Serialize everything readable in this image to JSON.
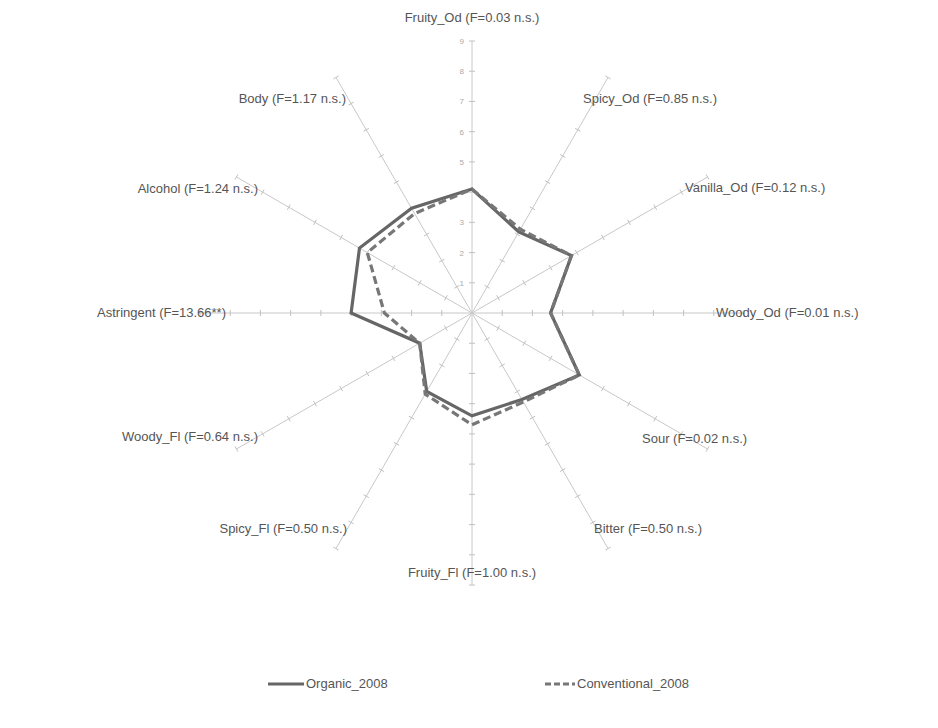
{
  "chart_data": {
    "type": "radar",
    "title": "",
    "axes": [
      {
        "name": "Fruity_Od",
        "label": "Fruity_Od (F=0.03 n.s.)"
      },
      {
        "name": "Spicy_Od",
        "label": "Spicy_Od (F=0.85 n.s.)"
      },
      {
        "name": "Vanilla_Od",
        "label": "Vanilla_Od (F=0.12 n.s.)"
      },
      {
        "name": "Woody_Od",
        "label": "Woody_Od (F=0.01 n.s.)"
      },
      {
        "name": "Sour",
        "label": "Sour (F=0.02 n.s.)"
      },
      {
        "name": "Bitter",
        "label": "Bitter (F=0.50 n.s.)"
      },
      {
        "name": "Fruity_Fl",
        "label": "Fruity_Fl (F=1.00 n.s.)"
      },
      {
        "name": "Spicy_Fl",
        "label": "Spicy_Fl (F=0.50 n.s.)"
      },
      {
        "name": "Woody_Fl",
        "label": "Woody_Fl (F=0.64 n.s.)"
      },
      {
        "name": "Astringent",
        "label": "Astringent (F=13.66**)"
      },
      {
        "name": "Alcohol",
        "label": "Alcohol (F=1.24 n.s.)"
      },
      {
        "name": "Body",
        "label": "Body (F=1.17 n.s.)"
      }
    ],
    "categories": [
      "Fruity_Od",
      "Spicy_Od",
      "Vanilla_Od",
      "Woody_Od",
      "Sour",
      "Bitter",
      "Fruity_Fl",
      "Spicy_Fl",
      "Woody_Fl",
      "Astringent",
      "Alcohol",
      "Body"
    ],
    "series": [
      {
        "name": "Organic_2008",
        "style": "solid",
        "color": "#666666",
        "values": [
          4.1,
          3.1,
          3.8,
          2.6,
          4.1,
          3.3,
          3.4,
          3.0,
          2.0,
          4.0,
          4.3,
          4.0
        ]
      },
      {
        "name": "Conventional_2008",
        "style": "dashed",
        "color": "#777777",
        "values": [
          4.1,
          3.2,
          3.8,
          2.6,
          4.1,
          3.4,
          3.7,
          3.1,
          2.0,
          2.9,
          4.0,
          3.8
        ]
      }
    ],
    "radial_ticks": [
      1,
      2,
      3,
      4,
      5,
      6,
      7,
      8,
      9
    ],
    "rlim": [
      0,
      9
    ],
    "grid": true,
    "legend_position": "bottom"
  },
  "legend": {
    "items": [
      {
        "label": "Organic_2008",
        "style": "solid"
      },
      {
        "label": "Conventional_2008",
        "style": "dashed"
      }
    ]
  }
}
